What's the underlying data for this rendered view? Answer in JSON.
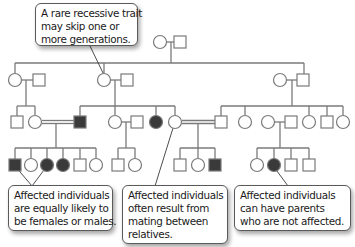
{
  "colors": {
    "line": "#7a7a7a",
    "affected_fill": "#3a3a3a",
    "unaffected_fill": "#ffffff",
    "callout_border": "#5a5a5a",
    "text": "#1a1a1a"
  },
  "callouts": [
    {
      "id": "skip-generations",
      "lines": [
        "A rare recessive trait",
        "may skip one or",
        "more generations."
      ]
    },
    {
      "id": "equal-sexes",
      "lines": [
        "Affected individuals",
        "are equally likely to",
        "be females or males."
      ]
    },
    {
      "id": "consanguinity",
      "lines": [
        "Affected individuals",
        "often result from",
        "mating between",
        "relatives."
      ]
    },
    {
      "id": "unaffected-parents",
      "lines": [
        "Affected individuals",
        "can have parents",
        "who are not affected."
      ]
    }
  ],
  "legend": {
    "circle": "female",
    "square": "male",
    "filled": "affected",
    "open": "unaffected",
    "double_line": "consanguineous mating"
  },
  "generations": [
    {
      "label": "I",
      "individuals": [
        {
          "sex": "female",
          "affected": false
        },
        {
          "sex": "male",
          "affected": false
        }
      ]
    },
    {
      "label": "II",
      "individuals": [
        {
          "sex": "female",
          "affected": false
        },
        {
          "sex": "male",
          "affected": false
        },
        {
          "sex": "female",
          "affected": false
        },
        {
          "sex": "male",
          "affected": false
        },
        {
          "sex": "female",
          "affected": false
        },
        {
          "sex": "male",
          "affected": false
        }
      ]
    },
    {
      "label": "III",
      "individuals": [
        {
          "sex": "male",
          "affected": false
        },
        {
          "sex": "female",
          "affected": false
        },
        {
          "sex": "male",
          "affected": true
        },
        {
          "sex": "female",
          "affected": false
        },
        {
          "sex": "male",
          "affected": false
        },
        {
          "sex": "female",
          "affected": true
        },
        {
          "sex": "female",
          "affected": false
        },
        {
          "sex": "male",
          "affected": false
        },
        {
          "sex": "female",
          "affected": false
        },
        {
          "sex": "female",
          "affected": false
        },
        {
          "sex": "male",
          "affected": false
        },
        {
          "sex": "female",
          "affected": false
        },
        {
          "sex": "male",
          "affected": false
        },
        {
          "sex": "female",
          "affected": false
        }
      ]
    },
    {
      "label": "IV",
      "individuals": [
        {
          "sex": "male",
          "affected": true
        },
        {
          "sex": "female",
          "affected": false
        },
        {
          "sex": "female",
          "affected": true
        },
        {
          "sex": "female",
          "affected": true
        },
        {
          "sex": "male",
          "affected": false
        },
        {
          "sex": "female",
          "affected": false
        },
        {
          "sex": "male",
          "affected": false
        },
        {
          "sex": "female",
          "affected": false
        },
        {
          "sex": "male",
          "affected": false
        },
        {
          "sex": "female",
          "affected": false
        },
        {
          "sex": "male",
          "affected": true
        },
        {
          "sex": "female",
          "affected": false
        },
        {
          "sex": "female",
          "affected": true
        },
        {
          "sex": "male",
          "affected": false
        },
        {
          "sex": "male",
          "affected": false
        }
      ]
    }
  ]
}
